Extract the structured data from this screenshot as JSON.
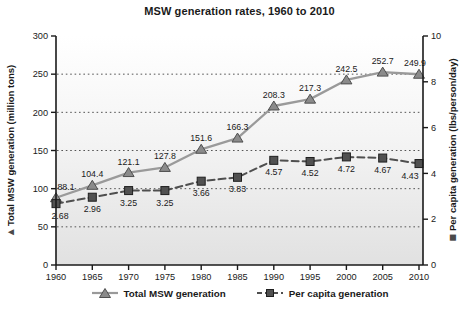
{
  "title": "MSW generation rates, 1960 to 2010",
  "legend": {
    "items": [
      {
        "label": "Total MSW generation"
      },
      {
        "label": "Per capita generation"
      }
    ]
  },
  "chart_data": {
    "type": "line",
    "title": "MSW generation rates, 1960 to 2010",
    "categories": [
      "1960",
      "1965",
      "1970",
      "1975",
      "1980",
      "1985",
      "1990",
      "1995",
      "2000",
      "2005",
      "2010"
    ],
    "series": [
      {
        "name": "Total MSW generation",
        "axis": "left",
        "marker": "triangle",
        "line_style": "solid",
        "values": [
          88.1,
          104.4,
          121.1,
          127.8,
          151.6,
          166.3,
          208.3,
          217.3,
          242.5,
          252.7,
          249.9
        ],
        "labels": [
          "88.1",
          "104.4",
          "121.1",
          "127.8",
          "151.6",
          "166.3",
          "208.3",
          "217.3",
          "242.5",
          "252.7",
          "249.9"
        ]
      },
      {
        "name": "Per capita generation",
        "axis": "right",
        "marker": "square",
        "line_style": "dashed",
        "values": [
          2.68,
          2.96,
          3.25,
          3.25,
          3.66,
          3.83,
          4.57,
          4.52,
          4.72,
          4.67,
          4.43
        ],
        "labels": [
          "2.68",
          "2.96",
          "3.25",
          "3.25",
          "3.66",
          "3.83",
          "4.57",
          "4.52",
          "4.72",
          "4.67",
          "4.43"
        ]
      }
    ],
    "left_axis": {
      "label": "Total MSW generation (million tons)",
      "glyph": "▲",
      "min": 0,
      "max": 300,
      "ticks": [
        0,
        50,
        100,
        150,
        200,
        250,
        300
      ],
      "tick_labels": [
        "0",
        "50",
        "100",
        "150",
        "200",
        "250",
        "300"
      ]
    },
    "right_axis": {
      "label": "Per capita generation (lbs/person/day)",
      "glyph": "■",
      "min": 0,
      "max": 10,
      "ticks": [
        0,
        2,
        4,
        6,
        8,
        10
      ],
      "tick_labels": [
        "0",
        "2",
        "4",
        "6",
        "8",
        "10"
      ]
    },
    "grid": {
      "horizontal_dotted_at_left_ticks": true
    },
    "legend_position": "bottom"
  },
  "colors": {
    "total_line": "#9a9a9a",
    "total_marker_fill": "#8b8b8b",
    "total_marker_edge": "#4f4f4f",
    "percap_line": "#4f4f4f",
    "percap_marker_fill": "#515151",
    "percap_marker_edge": "#1f1f1f",
    "grid": "#555555",
    "axis": "#1a1a1a",
    "text": "#1a1a1a",
    "plot_bg_top": "#ffffff",
    "plot_bg_mid": "#f4f4f4",
    "plot_bg_bottom": "#e1e1e1"
  }
}
